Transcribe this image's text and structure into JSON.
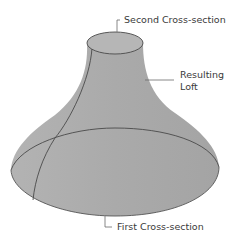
{
  "diagram": {
    "labels": {
      "second_cross_section": "Second Cross-section",
      "resulting_loft_line1": "Resulting",
      "resulting_loft_line2": "Loft",
      "first_cross_section": "First Cross-section"
    },
    "colors": {
      "surface": "#a9a9a9",
      "surface_light": "#bdbdbd",
      "top_cap": "#b4b4b4",
      "edge": "#4a4a4a",
      "leader": "#6a6a6a"
    }
  }
}
